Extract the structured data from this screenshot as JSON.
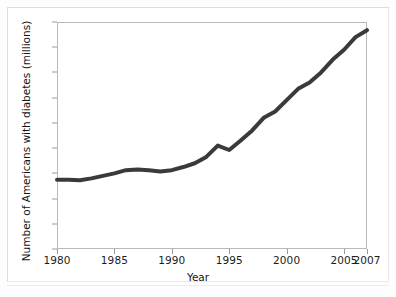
{
  "chart_data": {
    "type": "line",
    "title": "",
    "xlabel": "Year",
    "ylabel": "Number of Americans with diabetes (millions)",
    "xlim": [
      1980,
      2007
    ],
    "ylim": [
      0,
      18
    ],
    "grid": false,
    "legend": "none",
    "line_color": "#3a3a3a",
    "line_width": 4,
    "x_ticks": [
      1980,
      1985,
      1990,
      1995,
      2000,
      2005,
      2007
    ],
    "x_tick_labels": [
      "1980",
      "1985",
      "1990",
      "1995",
      "2000",
      "2005",
      "2007"
    ],
    "y_ticks": [
      0,
      2,
      4,
      6,
      8,
      10,
      12,
      14,
      16,
      18
    ],
    "y_tick_labels": [
      "0",
      "2",
      "4",
      "6",
      "8",
      "10",
      "12",
      "14",
      "16",
      "18"
    ],
    "x": [
      1980,
      1981,
      1982,
      1983,
      1984,
      1985,
      1986,
      1987,
      1988,
      1989,
      1990,
      1991,
      1992,
      1993,
      1994,
      1995,
      1996,
      1997,
      1998,
      1999,
      2000,
      2001,
      2002,
      2003,
      2004,
      2005,
      2006,
      2007
    ],
    "values": [
      5.5,
      5.5,
      5.45,
      5.6,
      5.8,
      6.0,
      6.25,
      6.3,
      6.25,
      6.15,
      6.25,
      6.5,
      6.8,
      7.3,
      8.2,
      7.85,
      8.6,
      9.4,
      10.4,
      10.9,
      11.8,
      12.7,
      13.2,
      14.0,
      15.0,
      15.8,
      16.8,
      17.35
    ],
    "series_name": "Americans with diabetes"
  },
  "axes": {
    "y_title": "Number of Americans with diabetes (millions)",
    "x_title": "Year"
  }
}
